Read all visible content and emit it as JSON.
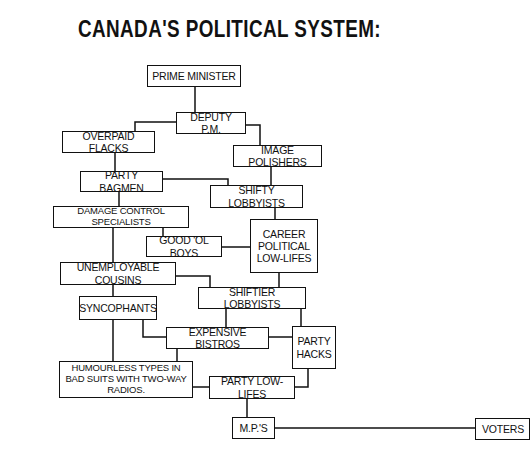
{
  "title": "Canada's Political System:",
  "boxes": {
    "prime_minister": "Prime Minister",
    "deputy_pm": "Deputy P.M.",
    "overpaid_flacks": "Overpaid Flacks",
    "image_polishers": "Image Polishers",
    "party_bagmen": "Party Bagmen",
    "shifty_lobbyists": "Shifty Lobbyists",
    "damage_control": "Damage Control Specialists",
    "good_ol_boys": "Good 'Ol Boys",
    "career_political": "Career Political Low-Lifes",
    "unemployable_cousins": "Unemployable Cousins",
    "shiftier_lobbyists": "Shiftier Lobbyists",
    "syncophants": "Syncophants",
    "expensive_bistros": "Expensive Bistros",
    "party_hacks": "Party Hacks",
    "humourless_types": "Humourless Types in Bad Suits with Two-Way Radios.",
    "party_low_lifes": "Party Low-Lifes",
    "mps": "M.P.'s",
    "voters": "Voters"
  }
}
